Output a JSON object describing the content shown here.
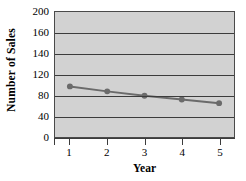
{
  "chart_data": {
    "type": "line",
    "title": "",
    "xlabel": "Year",
    "ylabel": "Number of Sales",
    "x": [
      1,
      2,
      3,
      4,
      5
    ],
    "categories": [
      "1",
      "2",
      "3",
      "4",
      "5"
    ],
    "values": [
      80,
      72,
      65,
      59,
      53
    ],
    "series": [
      {
        "name": "Number of Sales",
        "values": [
          80,
          72,
          65,
          59,
          53
        ]
      }
    ],
    "xlim": [
      0.6,
      5.4
    ],
    "ylim": [
      0,
      200
    ],
    "ytick_labels": [
      "200",
      "160",
      "140",
      "120",
      "80",
      "40",
      "0"
    ],
    "ytick_values": [
      200,
      160,
      140,
      120,
      80,
      40,
      0
    ],
    "xtick_labels": [
      "1",
      "2",
      "3",
      "4",
      "5"
    ],
    "grid": true,
    "grid_axis": "y",
    "legend": false,
    "legend_position": "none",
    "colors": {
      "plot_background": "#d2d2d2",
      "grid": "#3c3c3c",
      "axis": "#3c3c3c",
      "series_line": "#6b6b6b",
      "marker": "#6b6b6b",
      "text": "#000000",
      "page_background": "#ffffff"
    }
  }
}
